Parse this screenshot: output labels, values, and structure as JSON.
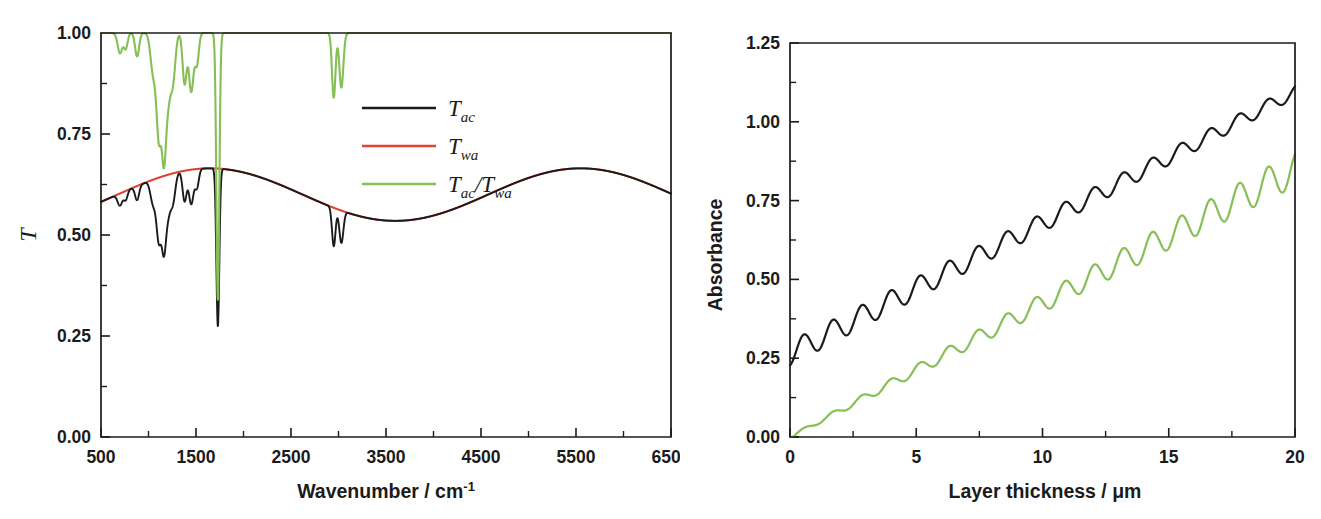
{
  "figure": {
    "panels": [
      "transmission-spectrum",
      "absorbance-vs-thickness"
    ],
    "background": "#ffffff"
  },
  "colors": {
    "black": "#1b1b1b",
    "red": "#dd4433",
    "green": "#85bf55",
    "axis": "#1b1b1b"
  },
  "left_panel": {
    "y_axis_title": "T",
    "x_axis_title_main": "Wavenumber / cm",
    "x_axis_title_sup": "-1",
    "legend": [
      {
        "label_base": "T",
        "label_sub": "ac",
        "color_key": "black",
        "name": "T_ac"
      },
      {
        "label_base": "T",
        "label_sub": "wa",
        "color_key": "red",
        "name": "T_wa"
      },
      {
        "label_base": "T",
        "label_sub": "ac",
        "label_mid": "/T",
        "label_sub2": "wa",
        "color_key": "green",
        "name": "T_ac/T_wa"
      }
    ]
  },
  "right_panel": {
    "y_axis_title": "Absorbance",
    "x_axis_title_main": "Layer thickness / ",
    "x_axis_title_unit": "μm"
  },
  "chart_data": [
    {
      "id": "transmission-spectrum",
      "type": "line",
      "title": "",
      "xlabel": "Wavenumber / cm-1",
      "ylabel": "T",
      "xlim": [
        500,
        6500
      ],
      "ylim": [
        0.0,
        1.0
      ],
      "xticks": [
        500,
        1500,
        2500,
        3500,
        4500,
        5500,
        6500
      ],
      "xticklabels": [
        "500",
        "1500",
        "2500",
        "3500",
        "4500",
        "5500",
        "6500"
      ],
      "yticks": [
        0.0,
        0.25,
        0.5,
        0.75,
        1.0
      ],
      "yticklabels": [
        "0.00",
        "0.25",
        "0.50",
        "0.75",
        "1.00"
      ],
      "minor_ticks_per_interval": 1,
      "grid": false,
      "legend_position": "upper-right-inside",
      "series": [
        {
          "name": "T_ac",
          "color_key": "black",
          "description": "Transmission of absorbing layer on substrate: interference baseline with IR absorption bands",
          "baseline": {
            "type": "sinusoidal-interference",
            "mean": 0.6,
            "amplitude": 0.065,
            "period_cm1": 3900,
            "phase_at_500": -1.85
          },
          "absorption_bands": [
            {
              "center": 700,
              "depth": 0.03,
              "width": 35
            },
            {
              "center": 760,
              "depth": 0.022,
              "width": 28
            },
            {
              "center": 880,
              "depth": 0.035,
              "width": 30
            },
            {
              "center": 1050,
              "depth": 0.06,
              "width": 40
            },
            {
              "center": 1110,
              "depth": 0.15,
              "width": 35
            },
            {
              "center": 1160,
              "depth": 0.135,
              "width": 30
            },
            {
              "center": 1200,
              "depth": 0.1,
              "width": 45
            },
            {
              "center": 1260,
              "depth": 0.06,
              "width": 35
            },
            {
              "center": 1380,
              "depth": 0.075,
              "width": 30
            },
            {
              "center": 1450,
              "depth": 0.085,
              "width": 35
            },
            {
              "center": 1510,
              "depth": 0.045,
              "width": 28
            },
            {
              "center": 1730,
              "depth": 0.39,
              "width": 22
            },
            {
              "center": 2950,
              "depth": 0.095,
              "width": 26
            },
            {
              "center": 3030,
              "depth": 0.08,
              "width": 30
            }
          ]
        },
        {
          "name": "T_wa",
          "color_key": "red",
          "description": "Transmission of window/substrate alone: smooth interference envelope, no absorption bands",
          "baseline": {
            "type": "sinusoidal-interference",
            "mean": 0.6,
            "amplitude": 0.065,
            "period_cm1": 3900,
            "phase_at_500": -1.85
          },
          "absorption_bands": []
        },
        {
          "name": "T_ac/T_wa",
          "color_key": "green",
          "description": "Ratio spectrum: flat at 1.00 with absorption bands only",
          "baseline": {
            "type": "constant",
            "mean": 1.0,
            "amplitude": 0.0,
            "period_cm1": 0,
            "phase_at_500": 0
          },
          "absorption_bands": [
            {
              "center": 700,
              "depth": 0.05,
              "width": 35
            },
            {
              "center": 760,
              "depth": 0.038,
              "width": 28
            },
            {
              "center": 880,
              "depth": 0.058,
              "width": 30
            },
            {
              "center": 1050,
              "depth": 0.1,
              "width": 40
            },
            {
              "center": 1110,
              "depth": 0.25,
              "width": 35
            },
            {
              "center": 1160,
              "depth": 0.225,
              "width": 30
            },
            {
              "center": 1200,
              "depth": 0.17,
              "width": 45
            },
            {
              "center": 1260,
              "depth": 0.1,
              "width": 35
            },
            {
              "center": 1380,
              "depth": 0.125,
              "width": 30
            },
            {
              "center": 1450,
              "depth": 0.145,
              "width": 35
            },
            {
              "center": 1510,
              "depth": 0.075,
              "width": 28
            },
            {
              "center": 1730,
              "depth": 0.66,
              "width": 22
            },
            {
              "center": 2950,
              "depth": 0.16,
              "width": 26
            },
            {
              "center": 3030,
              "depth": 0.135,
              "width": 30
            }
          ]
        }
      ]
    },
    {
      "id": "absorbance-vs-thickness",
      "type": "line",
      "title": "",
      "xlabel": "Layer thickness / μm",
      "ylabel": "Absorbance",
      "xlim": [
        0,
        20
      ],
      "ylim": [
        0.0,
        1.25
      ],
      "xticks": [
        0,
        5,
        10,
        15,
        20
      ],
      "xticklabels": [
        "0",
        "5",
        "10",
        "15",
        "20"
      ],
      "yticks": [
        0.0,
        0.25,
        0.5,
        0.75,
        1.0,
        1.25
      ],
      "yticklabels": [
        "0.00",
        "0.25",
        "0.50",
        "0.75",
        "1.00",
        "1.25"
      ],
      "minor_ticks_per_interval": 1,
      "grid": false,
      "legend_position": "none",
      "series": [
        {
          "name": "A_ac",
          "color_key": "black",
          "description": "Absorbance from single-beam transmission: offset ~0.27 at zero thickness, linear rise with small interference ripple",
          "intercept": 0.265,
          "slope": 0.0415,
          "ripple_amplitude_start": 0.038,
          "ripple_amplitude_end": 0.02,
          "ripple_period_um": 1.15,
          "ripple_phase": 3.3,
          "value_at_0": 0.265,
          "value_at_5": 0.455,
          "value_at_10": 0.675,
          "value_at_15": 0.875,
          "value_at_20": 1.08
        },
        {
          "color_key": "green",
          "name": "A_ratio",
          "description": "Absorbance from ratio spectrum: passes through origin, linear rise with growing interference ripple",
          "intercept": 0.0,
          "slope": 0.0425,
          "ripple_amplitude_start": 0.004,
          "ripple_amplitude_end": 0.055,
          "ripple_period_um": 1.15,
          "ripple_phase": 3.3,
          "value_at_0": 0.0,
          "value_at_5": 0.195,
          "value_at_10": 0.415,
          "value_at_15": 0.625,
          "value_at_20": 0.815
        }
      ]
    }
  ]
}
